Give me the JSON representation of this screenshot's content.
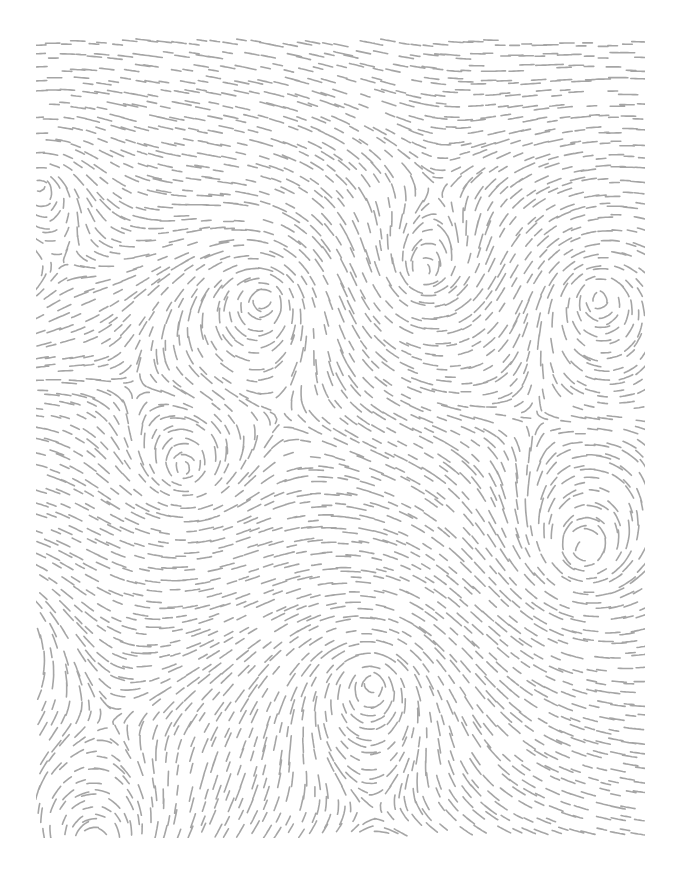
{
  "artwork": {
    "kind": "dashed-flow-field-pattern",
    "background_color": "#ffffff",
    "stroke_color": "#9b9b9b",
    "stroke_width": 1.6,
    "stroke_opacity": 0.9,
    "canvas": {
      "width": 673,
      "height": 876
    },
    "area": {
      "left": 38,
      "top": 40,
      "right": 643,
      "bottom": 836
    },
    "grid": {
      "spacing": 12.5,
      "jitter": 3.5,
      "skip_probability": 0.06
    },
    "dash": {
      "min_length": 9,
      "max_length": 17,
      "step": 2.4
    },
    "base_flow": {
      "x": 1.0,
      "y": 0.0
    },
    "seed": 1337,
    "vortices": [
      {
        "x": 40,
        "y": 185,
        "sigma": 75,
        "strength": 2.3,
        "dir": 1
      },
      {
        "x": 265,
        "y": 298,
        "sigma": 105,
        "strength": 2.5,
        "dir": 1
      },
      {
        "x": 425,
        "y": 272,
        "sigma": 95,
        "strength": 2.5,
        "dir": -1
      },
      {
        "x": 598,
        "y": 297,
        "sigma": 90,
        "strength": 2.5,
        "dir": 1
      },
      {
        "x": 185,
        "y": 470,
        "sigma": 80,
        "strength": 1.7,
        "dir": -1
      },
      {
        "x": 583,
        "y": 553,
        "sigma": 105,
        "strength": 2.5,
        "dir": -1
      },
      {
        "x": 372,
        "y": 682,
        "sigma": 110,
        "strength": 2.5,
        "dir": 1
      },
      {
        "x": 95,
        "y": 848,
        "sigma": 90,
        "strength": 2.2,
        "dir": -1
      },
      {
        "x": -15,
        "y": 620,
        "sigma": 85,
        "strength": 2.0,
        "dir": 1
      }
    ]
  }
}
